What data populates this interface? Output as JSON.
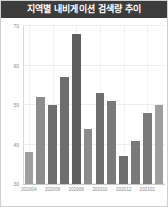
{
  "widget": {
    "title": "지역별 내비게이션 검색량 추이",
    "title_bar_color": "#3c3c3c",
    "title_text_color": "#ffffff",
    "background_color": "#ffffff",
    "border_color": "#cfcfcf"
  },
  "chart_data": {
    "type": "bar",
    "title": "지역별 내비게이션 검색량 추이",
    "xlabel": "",
    "ylabel": "",
    "categories": [
      "202004",
      "202005",
      "202006",
      "202007",
      "202008",
      "202009",
      "202010",
      "202011",
      "202012",
      "202101",
      "202102",
      "202103"
    ],
    "tick_labels": [
      "202004",
      "202006",
      "202008",
      "202010",
      "202012",
      "202102"
    ],
    "tick_indices": [
      0,
      2,
      4,
      6,
      8,
      10
    ],
    "values": [
      38,
      52,
      50,
      57,
      68,
      44,
      53,
      51,
      37,
      41,
      48,
      50
    ],
    "ylim": [
      30,
      70
    ],
    "yticks": [
      30,
      40,
      50,
      60,
      70
    ],
    "ytick_labels": [
      "30",
      "40",
      "50",
      "60",
      "70"
    ],
    "grid": true,
    "legend": false,
    "bar_colors": [
      "#9e9e9e",
      "#8c8c8c",
      "#6e6e6e",
      "#6e6e6e",
      "#5e5e5e",
      "#8c8c8c",
      "#6e6e6e",
      "#7a7a7a",
      "#6e6e6e",
      "#7a7a7a",
      "#7a7a7a",
      "#9e9e9e"
    ],
    "axis_color": "#c8c8c8",
    "grid_color": "#ededed",
    "tick_text_color": "#8a8a8a"
  }
}
